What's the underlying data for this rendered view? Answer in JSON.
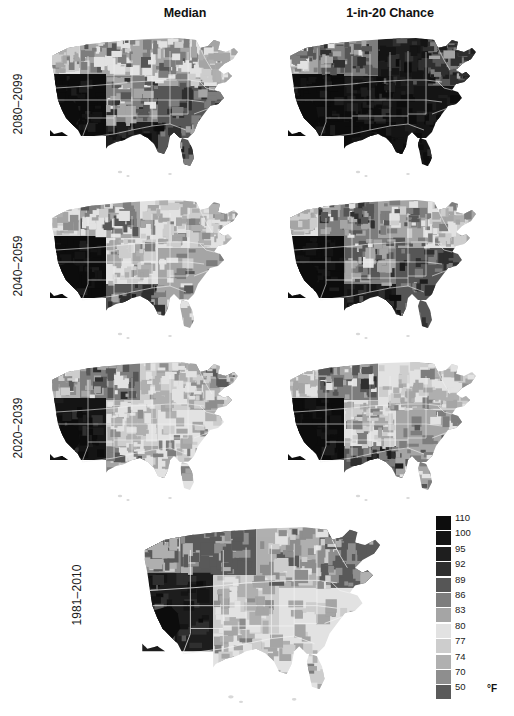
{
  "figure": {
    "title_columns": [
      {
        "id": "median",
        "label": "Median"
      },
      {
        "id": "chance",
        "label": "1-in-20 Chance"
      }
    ],
    "row_labels": [
      {
        "id": "r2080",
        "label": "2080–2099"
      },
      {
        "id": "r2040",
        "label": "2040–2059"
      },
      {
        "id": "r2020",
        "label": "2020–2039"
      },
      {
        "id": "r1981",
        "label": "1981–2010"
      }
    ]
  },
  "legend": {
    "unit": "°F",
    "entries": [
      {
        "value": "110",
        "color": "#0d0d0d"
      },
      {
        "value": "100",
        "color": "#141414"
      },
      {
        "value": "95",
        "color": "#1e1e1e"
      },
      {
        "value": "92",
        "color": "#2f2f2f"
      },
      {
        "value": "89",
        "color": "#565656"
      },
      {
        "value": "86",
        "color": "#7d7d7d"
      },
      {
        "value": "83",
        "color": "#a5a5a5"
      },
      {
        "value": "80",
        "color": "#e2e2e2"
      },
      {
        "value": "77",
        "color": "#cdcdcd"
      },
      {
        "value": "74",
        "color": "#b0b0b0"
      },
      {
        "value": "70",
        "color": "#8e8e8e"
      },
      {
        "value": "50",
        "color": "#5a5a5a"
      }
    ]
  },
  "chart_data": {
    "type": "heatmap",
    "xlabel": "",
    "ylabel": "",
    "columns": [
      "Median",
      "1-in-20 Chance"
    ],
    "rows": [
      "2080–2099",
      "2040–2059",
      "2020–2039",
      "1981–2010"
    ],
    "legend_position": "bottom-right",
    "grid": false,
    "colorbar": {
      "unit": "°F",
      "ticks": [
        110,
        100,
        95,
        92,
        89,
        86,
        83,
        80,
        77,
        74,
        70,
        50
      ],
      "colors": [
        "#0d0d0d",
        "#141414",
        "#1e1e1e",
        "#2f2f2f",
        "#565656",
        "#7d7d7d",
        "#a5a5a5",
        "#e2e2e2",
        "#cdcdcd",
        "#b0b0b0",
        "#8e8e8e",
        "#5a5a5a"
      ]
    },
    "panels": [
      {
        "row": "2080–2099",
        "column": "Median",
        "regions": [
          {
            "name": "Southwest (AZ/S. CA)",
            "value": 110
          },
          {
            "name": "Texas / Gulf Coast",
            "value": 95
          },
          {
            "name": "Southeast",
            "value": 89
          },
          {
            "name": "Great Plains",
            "value": 86
          },
          {
            "name": "Midwest",
            "value": 83
          },
          {
            "name": "Northeast",
            "value": 80
          },
          {
            "name": "Northern Rockies",
            "value": 83
          },
          {
            "name": "Pacific Northwest",
            "value": 80
          }
        ]
      },
      {
        "row": "2080–2099",
        "column": "1-in-20 Chance",
        "regions": [
          {
            "name": "Southwest (AZ/S. CA)",
            "value": 110
          },
          {
            "name": "Texas / Gulf Coast",
            "value": 110
          },
          {
            "name": "Southeast",
            "value": 100
          },
          {
            "name": "Great Plains",
            "value": 100
          },
          {
            "name": "Midwest",
            "value": 95
          },
          {
            "name": "Northeast",
            "value": 89
          },
          {
            "name": "Northern Rockies",
            "value": 86
          },
          {
            "name": "Pacific Northwest",
            "value": 83
          }
        ]
      },
      {
        "row": "2040–2059",
        "column": "Median",
        "regions": [
          {
            "name": "Southwest (AZ/S. CA)",
            "value": 110
          },
          {
            "name": "Texas / Gulf Coast",
            "value": 89
          },
          {
            "name": "Southeast",
            "value": 83
          },
          {
            "name": "Great Plains",
            "value": 80
          },
          {
            "name": "Midwest",
            "value": 80
          },
          {
            "name": "Northeast",
            "value": 77
          },
          {
            "name": "Northern Rockies",
            "value": 83
          },
          {
            "name": "Pacific Northwest",
            "value": 77
          }
        ]
      },
      {
        "row": "2040–2059",
        "column": "1-in-20 Chance",
        "regions": [
          {
            "name": "Southwest (AZ/S. CA)",
            "value": 110
          },
          {
            "name": "Texas / Gulf Coast",
            "value": 95
          },
          {
            "name": "Southeast",
            "value": 89
          },
          {
            "name": "Great Plains",
            "value": 86
          },
          {
            "name": "Midwest",
            "value": 83
          },
          {
            "name": "Northeast",
            "value": 80
          },
          {
            "name": "Northern Rockies",
            "value": 86
          },
          {
            "name": "Pacific Northwest",
            "value": 80
          }
        ]
      },
      {
        "row": "2020–2039",
        "column": "Median",
        "regions": [
          {
            "name": "Southwest (AZ/S. CA)",
            "value": 100
          },
          {
            "name": "Texas / Gulf Coast",
            "value": 83
          },
          {
            "name": "Southeast",
            "value": 80
          },
          {
            "name": "Great Plains",
            "value": 77
          },
          {
            "name": "Midwest",
            "value": 77
          },
          {
            "name": "Northeast",
            "value": 74
          },
          {
            "name": "Northern Rockies",
            "value": 86
          },
          {
            "name": "Pacific Northwest",
            "value": 74
          }
        ]
      },
      {
        "row": "2020–2039",
        "column": "1-in-20 Chance",
        "regions": [
          {
            "name": "Southwest (AZ/S. CA)",
            "value": 110
          },
          {
            "name": "Texas / Gulf Coast",
            "value": 89
          },
          {
            "name": "Southeast",
            "value": 83
          },
          {
            "name": "Great Plains",
            "value": 80
          },
          {
            "name": "Midwest",
            "value": 80
          },
          {
            "name": "Northeast",
            "value": 77
          },
          {
            "name": "Northern Rockies",
            "value": 86
          },
          {
            "name": "Pacific Northwest",
            "value": 77
          }
        ]
      },
      {
        "row": "1981–2010",
        "column": "",
        "regions": [
          {
            "name": "Southwest (AZ/S. CA)",
            "value": 95
          },
          {
            "name": "Texas / Gulf Coast",
            "value": 80
          },
          {
            "name": "Southeast",
            "value": 80
          },
          {
            "name": "Great Plains",
            "value": 77
          },
          {
            "name": "Midwest",
            "value": 74
          },
          {
            "name": "Northeast",
            "value": 50
          },
          {
            "name": "Northern Rockies",
            "value": 50
          },
          {
            "name": "Pacific Northwest",
            "value": 70
          }
        ]
      }
    ]
  }
}
